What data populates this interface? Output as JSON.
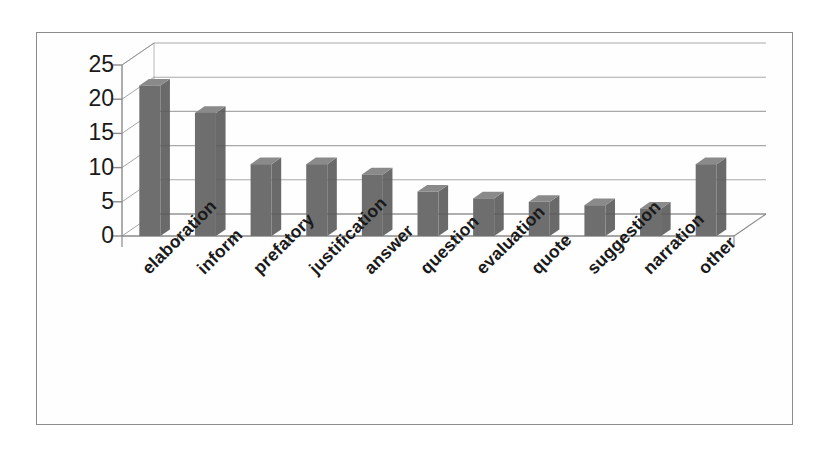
{
  "chart_data": {
    "type": "bar",
    "title": "",
    "subtitle": "",
    "xlabel": "",
    "ylabel": "",
    "categories": [
      "elaboration",
      "inform",
      "prefatory",
      "justification",
      "answer",
      "question",
      "evaluation",
      "quote",
      "suggestion",
      "narration",
      "other"
    ],
    "values": [
      22,
      18,
      10.5,
      10.5,
      9,
      6.5,
      5.5,
      5,
      4.5,
      4,
      10.5
    ],
    "series": [
      {
        "name": "count",
        "values": [
          22,
          18,
          10.5,
          10.5,
          9,
          6.5,
          5.5,
          5,
          4.5,
          4,
          10.5
        ]
      }
    ],
    "ylim": [
      0,
      25
    ],
    "y_ticks": [
      0,
      5,
      10,
      15,
      20,
      25
    ],
    "y_tick_labels": [
      "0",
      "5",
      "10",
      "15",
      "20",
      "25"
    ],
    "grid": true,
    "legend": false,
    "legend_position": "none",
    "style_3d": true,
    "bar_color": "#6e6e6e",
    "bar_side_color": "#5a5a5a",
    "bar_top_color": "#8a8a8a",
    "grid_color": "#9a9a9a",
    "axis_color": "#8a8a8a",
    "frame_color": "#8c8c8c",
    "text_color": "#1a1a1a",
    "background": "#ffffff",
    "label_rotation_deg": -45
  }
}
